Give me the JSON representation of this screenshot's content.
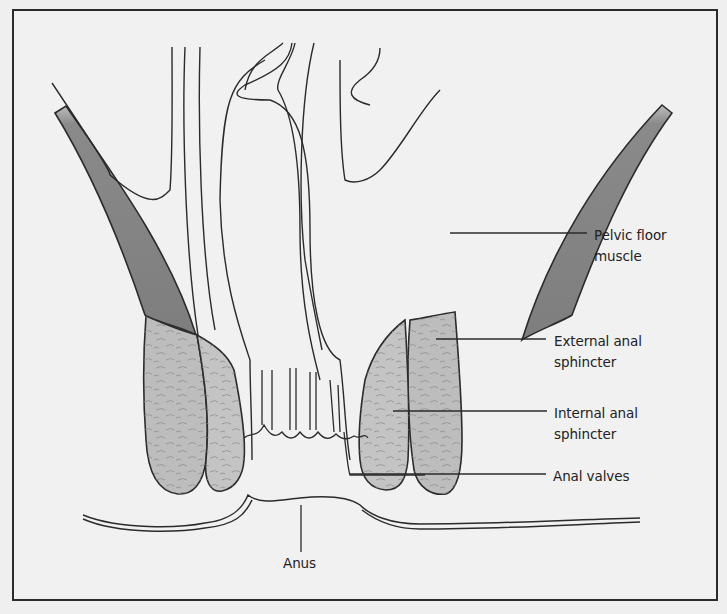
{
  "diagram": {
    "labels": {
      "pelvic_floor_line1": "Pelvic floor",
      "pelvic_floor_line2": "muscle",
      "external_sphincter_line1": "External anal",
      "external_sphincter_line2": "sphincter",
      "internal_sphincter_line1": "Internal anal",
      "internal_sphincter_line2": "sphincter",
      "anal_valves": "Anal valves",
      "anus": "Anus"
    },
    "colors": {
      "background": "#efefef",
      "outline": "#2b2b2b",
      "pelvic_floor_muscle": "#8a8a8a",
      "sphincter": "#bdbdbd",
      "fiber_texture": "#8f8f8f"
    }
  }
}
